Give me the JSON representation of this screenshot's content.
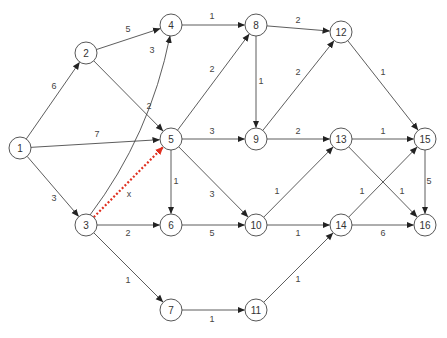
{
  "diagram": {
    "type": "directed-weighted-graph",
    "highlight_color": "#e03020",
    "node_radius": 11,
    "nodes": [
      {
        "id": "1",
        "label": "1",
        "x": 20,
        "y": 148
      },
      {
        "id": "2",
        "label": "2",
        "x": 86,
        "y": 53
      },
      {
        "id": "3",
        "label": "3",
        "x": 86,
        "y": 225
      },
      {
        "id": "4",
        "label": "4",
        "x": 171,
        "y": 25
      },
      {
        "id": "5",
        "label": "5",
        "x": 171,
        "y": 139
      },
      {
        "id": "6",
        "label": "6",
        "x": 171,
        "y": 225
      },
      {
        "id": "7",
        "label": "7",
        "x": 171,
        "y": 310
      },
      {
        "id": "8",
        "label": "8",
        "x": 256,
        "y": 25
      },
      {
        "id": "9",
        "label": "9",
        "x": 256,
        "y": 139
      },
      {
        "id": "10",
        "label": "10",
        "x": 256,
        "y": 225
      },
      {
        "id": "11",
        "label": "11",
        "x": 256,
        "y": 310
      },
      {
        "id": "12",
        "label": "12",
        "x": 341,
        "y": 32
      },
      {
        "id": "13",
        "label": "13",
        "x": 341,
        "y": 139
      },
      {
        "id": "14",
        "label": "14",
        "x": 341,
        "y": 225
      },
      {
        "id": "15",
        "label": "15",
        "x": 425,
        "y": 139
      },
      {
        "id": "16",
        "label": "16",
        "x": 425,
        "y": 225
      }
    ],
    "edges": [
      {
        "from": "1",
        "to": "2",
        "label": "6",
        "lx": 54,
        "ly": 86
      },
      {
        "from": "1",
        "to": "5",
        "label": "7",
        "lx": 97,
        "ly": 134
      },
      {
        "from": "1",
        "to": "3",
        "label": "3",
        "lx": 54,
        "ly": 198
      },
      {
        "from": "2",
        "to": "4",
        "label": "5",
        "lx": 128,
        "ly": 29
      },
      {
        "from": "2",
        "to": "5",
        "label": "2",
        "lx": 149,
        "ly": 106
      },
      {
        "from": "3",
        "to": "4",
        "label": "3",
        "lx": 152,
        "ly": 50,
        "curve": true
      },
      {
        "from": "3",
        "to": "6",
        "label": "2",
        "lx": 128,
        "ly": 233
      },
      {
        "from": "3",
        "to": "7",
        "label": "1",
        "lx": 128,
        "ly": 280
      },
      {
        "from": "3",
        "to": "5",
        "label": "x",
        "lx": 129,
        "ly": 194,
        "highlight": true
      },
      {
        "from": "4",
        "to": "8",
        "label": "1",
        "lx": 212,
        "ly": 16
      },
      {
        "from": "5",
        "to": "8",
        "label": "2",
        "lx": 212,
        "ly": 69
      },
      {
        "from": "5",
        "to": "9",
        "label": "3",
        "lx": 212,
        "ly": 131
      },
      {
        "from": "5",
        "to": "6",
        "label": "1",
        "lx": 176,
        "ly": 181
      },
      {
        "from": "5",
        "to": "10",
        "label": "3",
        "lx": 212,
        "ly": 194
      },
      {
        "from": "6",
        "to": "10",
        "label": "5",
        "lx": 212,
        "ly": 233
      },
      {
        "from": "7",
        "to": "11",
        "label": "1",
        "lx": 212,
        "ly": 319
      },
      {
        "from": "8",
        "to": "12",
        "label": "2",
        "lx": 298,
        "ly": 20
      },
      {
        "from": "8",
        "to": "9",
        "label": "1",
        "lx": 261,
        "ly": 81
      },
      {
        "from": "9",
        "to": "12",
        "label": "2",
        "lx": 298,
        "ly": 72
      },
      {
        "from": "9",
        "to": "13",
        "label": "2",
        "lx": 298,
        "ly": 131
      },
      {
        "from": "10",
        "to": "13",
        "label": "1",
        "lx": 277,
        "ly": 191
      },
      {
        "from": "10",
        "to": "14",
        "label": "1",
        "lx": 298,
        "ly": 233
      },
      {
        "from": "11",
        "to": "14",
        "label": "1",
        "lx": 298,
        "ly": 279
      },
      {
        "from": "12",
        "to": "15",
        "label": "1",
        "lx": 383,
        "ly": 72
      },
      {
        "from": "13",
        "to": "15",
        "label": "1",
        "lx": 383,
        "ly": 131
      },
      {
        "from": "13",
        "to": "16",
        "label": "1",
        "lx": 402,
        "ly": 191
      },
      {
        "from": "14",
        "to": "15",
        "label": "1",
        "lx": 362,
        "ly": 191
      },
      {
        "from": "14",
        "to": "16",
        "label": "6",
        "lx": 383,
        "ly": 233
      },
      {
        "from": "15",
        "to": "16",
        "label": "5",
        "lx": 429,
        "ly": 181
      }
    ]
  }
}
